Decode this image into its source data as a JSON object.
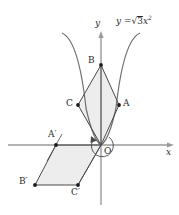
{
  "figure": {
    "title": "",
    "background_color": "#ffffff",
    "canvas": {
      "width": 179,
      "height": 215
    },
    "axes": {
      "x_label": "x",
      "y_label": "y",
      "axis_color": "#9a9a9a",
      "origin_px": {
        "x": 101,
        "y": 145
      },
      "x_axis_from_px": {
        "x": 8,
        "y": 145
      },
      "x_axis_to_px": {
        "x": 174,
        "y": 145
      },
      "y_axis_from_px": {
        "x": 101,
        "y": 205
      },
      "y_axis_to_px": {
        "x": 101,
        "y": 31
      }
    },
    "curve": {
      "equation_label": "y = √3x²",
      "equation_parts": {
        "lhs": "y",
        "eq": "=",
        "radicand": "3",
        "var": "x",
        "exponent": "2"
      },
      "color": "#6e6e6e",
      "type": "parabola"
    },
    "shapes": [
      {
        "name": "upper-rhombus",
        "vertices": [
          "O",
          "A",
          "B",
          "C"
        ],
        "fill": "#ededed",
        "stroke": "#4a4a4a"
      },
      {
        "name": "lower-parallelogram",
        "vertices": [
          "O",
          "A'",
          "B'",
          "C'"
        ],
        "fill": "#ededed",
        "stroke": "#4a4a4a"
      }
    ],
    "rotation_arc": {
      "name": "rotation-arc",
      "color": "#4a4a4a",
      "direction": "counterclockwise"
    },
    "points": [
      {
        "label": "B",
        "x": 101,
        "y": 65,
        "lx": 88,
        "ly": 58,
        "dot": true
      },
      {
        "label": "A",
        "x": 119,
        "y": 105,
        "lx": 123,
        "ly": 99,
        "dot": true
      },
      {
        "label": "C",
        "x": 78,
        "y": 105,
        "lx": 66,
        "ly": 99,
        "dot": true
      },
      {
        "label": "O",
        "x": 101,
        "y": 145,
        "lx": 104,
        "ly": 147,
        "dot": false
      },
      {
        "label": "A′",
        "x": 56,
        "y": 145,
        "lx": 48,
        "ly": 131,
        "dot": true
      },
      {
        "label": "B′",
        "x": 35,
        "y": 185,
        "lx": 19,
        "ly": 178,
        "dot": true
      },
      {
        "label": "C′",
        "x": 78,
        "y": 185,
        "lx": 72,
        "ly": 188,
        "dot": true
      }
    ]
  }
}
